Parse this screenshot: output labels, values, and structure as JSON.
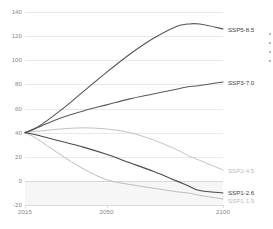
{
  "chart_data": {
    "type": "line",
    "title": "",
    "xlabel": "",
    "ylabel": "",
    "xlim": [
      2015,
      2100
    ],
    "ylim": [
      -20,
      140
    ],
    "grid": true,
    "legend_position": "right-inline-labels",
    "x_ticks": [
      {
        "value": 2015,
        "label": "2015"
      },
      {
        "value": 2050,
        "label": "2050"
      },
      {
        "value": 2100,
        "label": "2100"
      }
    ],
    "y_ticks": [
      {
        "value": 140,
        "label": "140"
      },
      {
        "value": 120,
        "label": "120"
      },
      {
        "value": 100,
        "label": "100"
      },
      {
        "value": 80,
        "label": "80"
      },
      {
        "value": 60,
        "label": "60"
      },
      {
        "value": 40,
        "label": "40"
      },
      {
        "value": 20,
        "label": "20"
      },
      {
        "value": 0,
        "label": "0"
      },
      {
        "value": -20,
        "label": "-20"
      }
    ],
    "x": [
      2015,
      2020,
      2030,
      2040,
      2050,
      2060,
      2070,
      2080,
      2085,
      2090,
      2100
    ],
    "series": [
      {
        "name": "SSP5-8.5",
        "label": "SSP5-8.5",
        "color": "#555555",
        "width": 1.1,
        "values": [
          40,
          44,
          58,
          74,
          90,
          105,
          118,
          128,
          130,
          130,
          126
        ]
      },
      {
        "name": "SSP3-7.0",
        "label": "SSP3-7.0",
        "color": "#5a5a5a",
        "width": 1.1,
        "values": [
          40,
          44,
          52,
          58,
          63,
          68,
          72,
          76,
          78,
          79,
          82
        ]
      },
      {
        "name": "SSP2-4.5",
        "label": "SSP2-4.5",
        "color": "#c2c2c2",
        "width": 1.0,
        "values": [
          40,
          41,
          43,
          44,
          43,
          40,
          34,
          26,
          21,
          17,
          9
        ]
      },
      {
        "name": "SSP1-2.6",
        "label": "SSP1-2.6",
        "color": "#4a4a4a",
        "width": 1.1,
        "values": [
          40,
          38,
          33,
          28,
          22,
          15,
          8,
          0,
          -4,
          -8,
          -10
        ]
      },
      {
        "name": "SSP1-1.9",
        "label": "SSP1-1.9",
        "color": "#bdbdbd",
        "width": 1.0,
        "values": [
          40,
          35,
          22,
          10,
          1,
          -3,
          -6,
          -9,
          -10,
          -12,
          -15
        ]
      }
    ],
    "annotations": {
      "negative_band": {
        "from": 0,
        "to": -20,
        "color": "#f6f6f6"
      },
      "zero_line": {
        "value": 0,
        "color": "#d8d8d8"
      }
    }
  },
  "labels": {
    "ssp5": "SSP5-8.5",
    "ssp3": "SSP3-7.0",
    "ssp2": "SSP2-4.5",
    "ssp1_26": "SSP1-2.6",
    "ssp1_19": "SSP1-1.9"
  },
  "colors": {
    "dark_line": "#555555",
    "light_line": "#c2c2c2",
    "grid": "#e9e9e9",
    "tick_text": "#8a8a8a",
    "label_dark": "#3f3f3f",
    "label_light": "#bdbdbd",
    "background": "#ffffff"
  }
}
